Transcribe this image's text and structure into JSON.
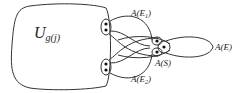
{
  "diagram": {
    "region_label": {
      "main": "U",
      "sub": "g(j)"
    },
    "labels": {
      "e1": {
        "base": "A(E",
        "sub": "1",
        "close": ")"
      },
      "e2": {
        "base": "A(E",
        "sub": "2",
        "close": ")"
      },
      "s": "A(S)",
      "e": "A(E)"
    },
    "colors": {
      "stroke": "#333333",
      "background": "#ffffff"
    }
  }
}
